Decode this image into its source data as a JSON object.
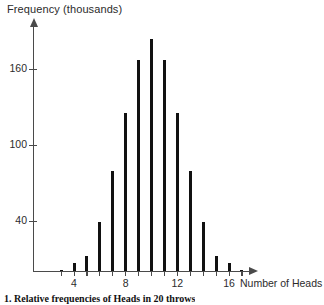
{
  "chart_data": {
    "type": "bar",
    "title": "",
    "xlabel": "Number of Heads",
    "ylabel": "Frequency (thousands)",
    "categories": [
      3,
      4,
      5,
      6,
      7,
      8,
      9,
      10,
      11,
      12,
      13,
      14,
      15,
      16,
      17
    ],
    "values": [
      1,
      6,
      12,
      39,
      79,
      125,
      167,
      184,
      167,
      125,
      79,
      39,
      12,
      6,
      1
    ],
    "xlim": [
      2,
      18
    ],
    "ylim": [
      0,
      195
    ],
    "xticks": [
      4,
      8,
      12,
      16
    ],
    "xtick_labels": [
      "4",
      "8",
      "12",
      "16"
    ],
    "yticks": [
      40,
      100,
      160
    ],
    "ytick_labels": [
      "40",
      "100",
      "160"
    ],
    "grid": false,
    "legend": null,
    "bar_color": "#111111",
    "axis_color": "#4a4a4a"
  },
  "figure": {
    "caption": "1.  Relative frequencies of Heads in 20 throws"
  }
}
